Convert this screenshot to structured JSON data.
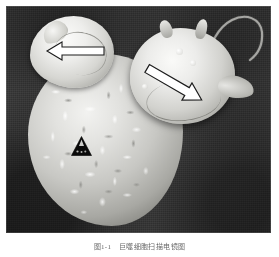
{
  "figure": {
    "kind": "scanning-electron-micrograph",
    "caption": "图1-1　巨噬细胞扫描电镜图",
    "background_color": "#3a3a3a",
    "specimen_color": "#eeeeec",
    "marker_color": "#ffffff",
    "triangle_color": "#000000",
    "frame_color": "#ffffff"
  },
  "annotations": {
    "arrow_left": {
      "name": "白色箭头（左）",
      "label": "",
      "direction": "left",
      "points_to": "upper-left attached cell"
    },
    "arrow_right": {
      "name": "白色箭头（右）",
      "label": "",
      "direction": "down-right",
      "points_to": "right attached cell"
    },
    "triangle": {
      "name": "黑色三角标记",
      "label": "",
      "points_to": "microvilli surface of macrophage"
    }
  },
  "structures": {
    "macrophage": "巨噬细胞",
    "cell_left": "附着细胞（左上）",
    "cell_right": "附着细胞（右）",
    "flagellum": "丝状伪足"
  }
}
